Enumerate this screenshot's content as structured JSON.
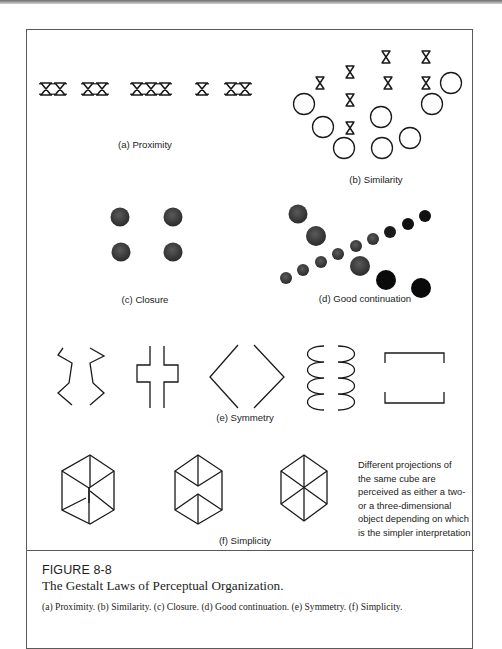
{
  "figure": {
    "number": "FIGURE 8-8",
    "title": "The Gestalt Laws of Perceptual Organization.",
    "caption": "(a) Proximity. (b) Similarity. (c) Closure. (d) Good continuation. (e) Symmetry. (f) Simplicity."
  },
  "panels": {
    "proximity": {
      "label": "(a) Proximity",
      "groups": [
        "XX",
        "XX",
        "XXX",
        "X",
        "XX"
      ]
    },
    "similarity": {
      "label": "(b) Similarity"
    },
    "closure": {
      "label": "(c) Closure"
    },
    "continuation": {
      "label": "(d) Good continuation"
    },
    "symmetry": {
      "label": "(e) Symmetry"
    },
    "simplicity": {
      "label": "(f) Simplicity",
      "note_lines": [
        "Different projections of",
        "the same cube are",
        "perceived as either a two-",
        "or a three-dimensional",
        "object depending on which",
        "is the simpler interpretation"
      ]
    }
  },
  "colors": {
    "ink": "#1a1a1a",
    "dot_grey": "#3d3d3d",
    "dot_black": "#0a0a0a",
    "frame": "#5a5a5a"
  }
}
